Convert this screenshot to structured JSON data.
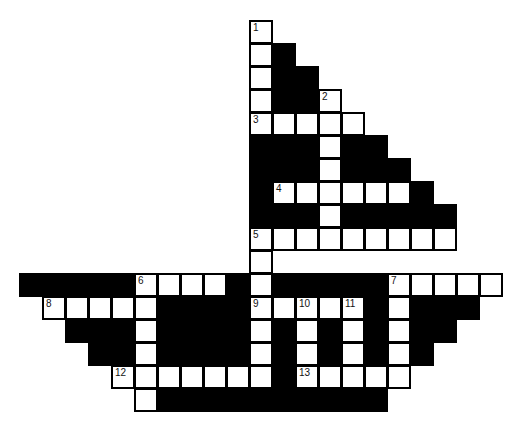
{
  "puzzle": {
    "type": "crossword",
    "shape": "sailboat",
    "cell_size": 23,
    "origin": {
      "x": 19,
      "y": 20
    },
    "colors": {
      "white": "#ffffff",
      "black": "#000000",
      "border": "#000000"
    },
    "rows": [
      {
        "r": 0,
        "cells": [
          [
            10,
            "W",
            1
          ]
        ]
      },
      {
        "r": 1,
        "cells": [
          [
            10,
            "W"
          ],
          [
            11,
            "B"
          ]
        ]
      },
      {
        "r": 2,
        "cells": [
          [
            10,
            "W"
          ],
          [
            11,
            "B"
          ],
          [
            12,
            "B"
          ]
        ]
      },
      {
        "r": 3,
        "cells": [
          [
            10,
            "W"
          ],
          [
            11,
            "B"
          ],
          [
            12,
            "B"
          ],
          [
            13,
            "W",
            2
          ]
        ]
      },
      {
        "r": 4,
        "cells": [
          [
            10,
            "W",
            3
          ],
          [
            11,
            "W"
          ],
          [
            12,
            "W"
          ],
          [
            13,
            "W"
          ],
          [
            14,
            "W"
          ]
        ]
      },
      {
        "r": 5,
        "cells": [
          [
            10,
            "B"
          ],
          [
            11,
            "B"
          ],
          [
            12,
            "B"
          ],
          [
            13,
            "W"
          ],
          [
            14,
            "B"
          ],
          [
            15,
            "B"
          ]
        ]
      },
      {
        "r": 6,
        "cells": [
          [
            10,
            "B"
          ],
          [
            11,
            "B"
          ],
          [
            12,
            "B"
          ],
          [
            13,
            "W"
          ],
          [
            14,
            "B"
          ],
          [
            15,
            "B"
          ],
          [
            16,
            "B"
          ]
        ]
      },
      {
        "r": 7,
        "cells": [
          [
            10,
            "B"
          ],
          [
            11,
            "W",
            4
          ],
          [
            12,
            "W"
          ],
          [
            13,
            "W"
          ],
          [
            14,
            "W"
          ],
          [
            15,
            "W"
          ],
          [
            16,
            "W"
          ],
          [
            17,
            "B"
          ]
        ]
      },
      {
        "r": 8,
        "cells": [
          [
            10,
            "B"
          ],
          [
            11,
            "B"
          ],
          [
            12,
            "B"
          ],
          [
            13,
            "W"
          ],
          [
            14,
            "B"
          ],
          [
            15,
            "B"
          ],
          [
            16,
            "B"
          ],
          [
            17,
            "B"
          ],
          [
            18,
            "B"
          ]
        ]
      },
      {
        "r": 9,
        "cells": [
          [
            10,
            "W",
            5
          ],
          [
            11,
            "W"
          ],
          [
            12,
            "W"
          ],
          [
            13,
            "W"
          ],
          [
            14,
            "W"
          ],
          [
            15,
            "W"
          ],
          [
            16,
            "W"
          ],
          [
            17,
            "W"
          ],
          [
            18,
            "W"
          ]
        ]
      },
      {
        "r": 10,
        "cells": [
          [
            10,
            "W"
          ]
        ]
      },
      {
        "r": 11,
        "cells": [
          [
            0,
            "B"
          ],
          [
            1,
            "B"
          ],
          [
            2,
            "B"
          ],
          [
            3,
            "B"
          ],
          [
            4,
            "B"
          ],
          [
            5,
            "W",
            6
          ],
          [
            6,
            "W"
          ],
          [
            7,
            "W"
          ],
          [
            8,
            "W"
          ],
          [
            9,
            "B"
          ],
          [
            10,
            "W"
          ],
          [
            11,
            "B"
          ],
          [
            12,
            "B"
          ],
          [
            13,
            "B"
          ],
          [
            14,
            "B"
          ],
          [
            15,
            "B"
          ],
          [
            16,
            "W",
            7
          ],
          [
            17,
            "W"
          ],
          [
            18,
            "W"
          ],
          [
            19,
            "W"
          ],
          [
            20,
            "W"
          ]
        ]
      },
      {
        "r": 12,
        "cells": [
          [
            1,
            "W",
            8
          ],
          [
            2,
            "W"
          ],
          [
            3,
            "W"
          ],
          [
            4,
            "W"
          ],
          [
            5,
            "W"
          ],
          [
            6,
            "B"
          ],
          [
            7,
            "B"
          ],
          [
            8,
            "B"
          ],
          [
            9,
            "B"
          ],
          [
            10,
            "W",
            9
          ],
          [
            11,
            "W"
          ],
          [
            12,
            "W",
            10
          ],
          [
            13,
            "W"
          ],
          [
            14,
            "W",
            11
          ],
          [
            15,
            "B"
          ],
          [
            16,
            "W"
          ],
          [
            17,
            "B"
          ],
          [
            18,
            "B"
          ],
          [
            19,
            "B"
          ]
        ]
      },
      {
        "r": 13,
        "cells": [
          [
            2,
            "B"
          ],
          [
            3,
            "B"
          ],
          [
            4,
            "B"
          ],
          [
            5,
            "W"
          ],
          [
            6,
            "B"
          ],
          [
            7,
            "B"
          ],
          [
            8,
            "B"
          ],
          [
            9,
            "B"
          ],
          [
            10,
            "W"
          ],
          [
            11,
            "B"
          ],
          [
            12,
            "W"
          ],
          [
            13,
            "B"
          ],
          [
            14,
            "W"
          ],
          [
            15,
            "B"
          ],
          [
            16,
            "W"
          ],
          [
            17,
            "B"
          ],
          [
            18,
            "B"
          ]
        ]
      },
      {
        "r": 14,
        "cells": [
          [
            3,
            "B"
          ],
          [
            4,
            "B"
          ],
          [
            5,
            "W"
          ],
          [
            6,
            "B"
          ],
          [
            7,
            "B"
          ],
          [
            8,
            "B"
          ],
          [
            9,
            "B"
          ],
          [
            10,
            "W"
          ],
          [
            11,
            "B"
          ],
          [
            12,
            "W"
          ],
          [
            13,
            "B"
          ],
          [
            14,
            "W"
          ],
          [
            15,
            "B"
          ],
          [
            16,
            "W"
          ],
          [
            17,
            "B"
          ]
        ]
      },
      {
        "r": 15,
        "cells": [
          [
            4,
            "W",
            12
          ],
          [
            5,
            "W"
          ],
          [
            6,
            "W"
          ],
          [
            7,
            "W"
          ],
          [
            8,
            "W"
          ],
          [
            9,
            "W"
          ],
          [
            10,
            "W"
          ],
          [
            11,
            "B"
          ],
          [
            12,
            "W",
            13
          ],
          [
            13,
            "W"
          ],
          [
            14,
            "W"
          ],
          [
            15,
            "W"
          ],
          [
            16,
            "W"
          ]
        ]
      },
      {
        "r": 16,
        "cells": [
          [
            5,
            "W"
          ],
          [
            6,
            "B"
          ],
          [
            7,
            "B"
          ],
          [
            8,
            "B"
          ],
          [
            9,
            "B"
          ],
          [
            10,
            "B"
          ],
          [
            11,
            "B"
          ],
          [
            12,
            "B"
          ],
          [
            13,
            "B"
          ],
          [
            14,
            "B"
          ],
          [
            15,
            "B"
          ]
        ]
      }
    ],
    "clue_numbers": [
      1,
      2,
      3,
      4,
      5,
      6,
      7,
      8,
      9,
      10,
      11,
      12,
      13
    ]
  }
}
